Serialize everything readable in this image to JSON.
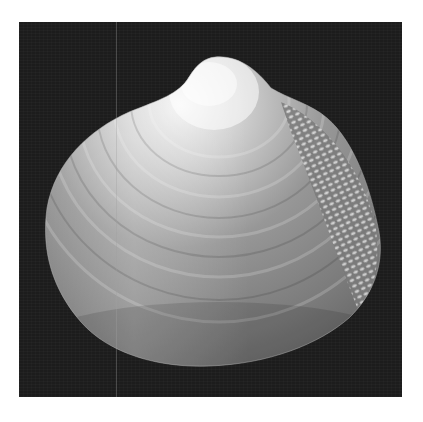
{
  "image": {
    "subject": "bivalve seashell (clam) on dark background",
    "style": "grayscale photograph",
    "colors": {
      "page_background": "#ffffff",
      "photo_background": "#1c1c1c",
      "shell_highlight": "#f2f2f2",
      "shell_midtone": "#8a8a8a",
      "shell_shadow": "#5e5e5e"
    },
    "features": [
      "umbo (beak) highlight at top",
      "concentric growth rings",
      "textured/beaded posterior area on right side",
      "faint vertical scan line artifact"
    ]
  }
}
